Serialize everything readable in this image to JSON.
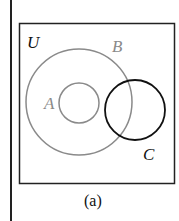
{
  "diagram": {
    "universe_label": "U",
    "sets": [
      {
        "label": "A",
        "color": "#8a8a8a"
      },
      {
        "label": "B",
        "color": "#8a8a8a"
      },
      {
        "label": "C",
        "color": "#111111"
      }
    ],
    "caption": "(a)"
  }
}
